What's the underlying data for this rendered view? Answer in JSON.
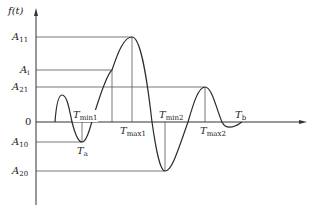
{
  "axes": {
    "y_label": "f(t)",
    "zero_label": "0"
  },
  "levels": [
    {
      "name": "A",
      "sub": "11",
      "y": 37
    },
    {
      "name": "A",
      "sub": "i",
      "y": 70
    },
    {
      "name": "A",
      "sub": "21",
      "y": 87
    },
    {
      "name": "A",
      "sub": "10",
      "y": 142
    },
    {
      "name": "A",
      "sub": "20",
      "y": 171
    }
  ],
  "time_labels": {
    "t_min1": {
      "name": "T",
      "sub": "min1"
    },
    "t_a": {
      "name": "T",
      "sub": "a"
    },
    "t_max1": {
      "name": "T",
      "sub": "max1"
    },
    "t_min2": {
      "name": "T",
      "sub": "min2"
    },
    "t_max2": {
      "name": "T",
      "sub": "max2"
    },
    "t_b": {
      "name": "T",
      "sub": "b"
    }
  },
  "colors": {
    "curve": "#2a2a2a",
    "guide": "#555555",
    "axis": "#333333"
  }
}
